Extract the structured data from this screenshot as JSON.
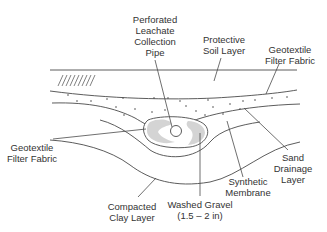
{
  "diagram": {
    "colors": {
      "line": "#4a4a4a",
      "gravel_fill": "#d4d4d4",
      "text": "#333333",
      "background": "#ffffff"
    },
    "labels": {
      "pipe": {
        "lines": [
          "Perforated",
          "Leachate",
          "Collection",
          "Pipe"
        ]
      },
      "protective_soil": {
        "lines": [
          "Protective",
          "Soil Layer"
        ]
      },
      "geotextile_top": {
        "lines": [
          "Geotextile",
          "Filter Fabric"
        ]
      },
      "geotextile_left": {
        "lines": [
          "Geotextile",
          "Filter Fabric"
        ]
      },
      "sand_drainage": {
        "lines": [
          "Sand",
          "Drainage",
          "Layer"
        ]
      },
      "synthetic_membrane": {
        "lines": [
          "Synthetic",
          "Membrane"
        ]
      },
      "washed_gravel": {
        "lines": [
          "Washed Gravel",
          "(1.5 – 2 in)"
        ]
      },
      "compacted_clay": {
        "lines": [
          "Compacted",
          "Clay Layer"
        ]
      }
    }
  }
}
